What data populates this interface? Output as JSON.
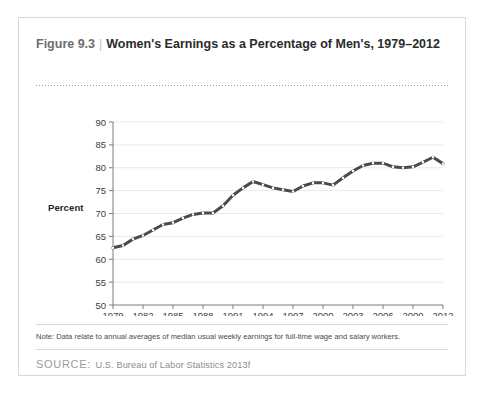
{
  "figure": {
    "number_label": "Figure 9.3",
    "separator": "|",
    "title": "Women's Earnings as a Percentage of Men's, 1979–2012",
    "note": "Note: Data relate to annual averages of median usual weekly earnings for full-time wage and salary workers.",
    "source_label": "SOURCE:",
    "source_body": "U.S. Bureau of Labor Statistics 2013f"
  },
  "chart_data": {
    "type": "line",
    "title": "Women's Earnings as a Percentage of Men's, 1979–2012",
    "xlabel": "",
    "ylabel": "Percent",
    "xlim": [
      1979,
      2012
    ],
    "ylim": [
      50,
      90
    ],
    "ytick_step": 5,
    "yticks": [
      50,
      55,
      60,
      65,
      70,
      75,
      80,
      85,
      90
    ],
    "xticks": [
      1979,
      1982,
      1985,
      1988,
      1991,
      1994,
      1997,
      2000,
      2003,
      2006,
      2009,
      2012
    ],
    "grid": "horizontal",
    "legend": "none",
    "line_color": "#4a4a4a",
    "marker_color": "#ffffff",
    "x": [
      1979,
      1980,
      1981,
      1982,
      1983,
      1984,
      1985,
      1986,
      1987,
      1988,
      1989,
      1990,
      1991,
      1992,
      1993,
      1994,
      1995,
      1996,
      1997,
      1998,
      1999,
      2000,
      2001,
      2002,
      2003,
      2004,
      2005,
      2006,
      2007,
      2008,
      2009,
      2010,
      2011,
      2012
    ],
    "values": [
      62.5,
      63.0,
      64.4,
      65.2,
      66.4,
      67.6,
      68.0,
      69.0,
      69.8,
      70.1,
      70.1,
      71.7,
      74.0,
      75.6,
      77.0,
      76.3,
      75.6,
      75.2,
      74.8,
      76.0,
      76.7,
      76.7,
      76.2,
      77.8,
      79.3,
      80.5,
      81.0,
      81.0,
      80.2,
      80.0,
      80.2,
      81.2,
      82.3,
      80.9
    ],
    "annotations": []
  }
}
